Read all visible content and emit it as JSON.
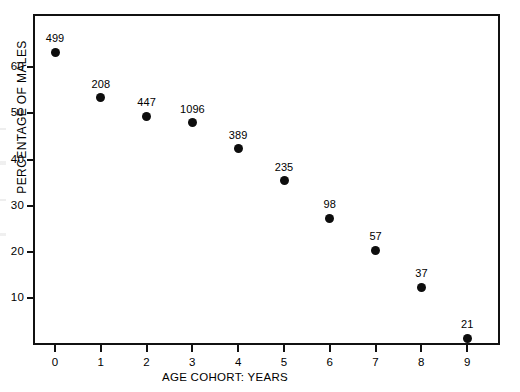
{
  "chart_data": {
    "type": "scatter",
    "title": "",
    "xlabel": "AGE COHORT: YEARS",
    "ylabel": "PERCENTAGE OF MALES",
    "x": [
      0,
      1,
      2,
      3,
      4,
      5,
      6,
      7,
      8,
      9
    ],
    "values": [
      63.2,
      53.3,
      49.4,
      47.9,
      42.3,
      35.4,
      27.3,
      20.4,
      12.4,
      1.4
    ],
    "point_labels": [
      "499",
      "208",
      "447",
      "1096",
      "389",
      "235",
      "98",
      "57",
      "37",
      "21"
    ],
    "xlim": [
      -0.5,
      9.7
    ],
    "ylim": [
      0,
      71.5
    ],
    "xticks": [
      "0",
      "1",
      "2",
      "3",
      "4",
      "5",
      "6",
      "7",
      "8",
      "9"
    ],
    "xtick_values": [
      0,
      1,
      2,
      3,
      4,
      5,
      6,
      7,
      8,
      9
    ],
    "yticks": [
      "10",
      "20",
      "30",
      "40",
      "50",
      "60"
    ],
    "ytick_values": [
      10,
      20,
      30,
      40,
      50,
      60
    ],
    "grid": false,
    "legend": "none",
    "marker_color": "#0d0d0d",
    "axis_color": "#111111",
    "background_color": "#ffffff",
    "annotation_note": "Each data point is annotated with its sample count (n)."
  }
}
